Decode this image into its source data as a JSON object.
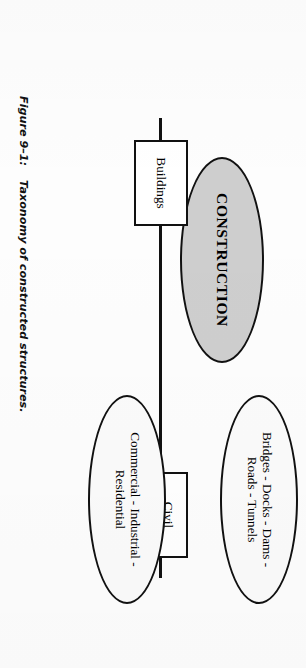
{
  "figure": {
    "caption_number": "Figure 9–1:",
    "caption_text": "Taxonomy of constructed structures.",
    "orientation": "rotated-90-clockwise",
    "colors": {
      "root_fill": "#cecece",
      "node_fill": "#ffffff",
      "stroke": "#111111",
      "page_background": "#ffffff"
    }
  },
  "diagram": {
    "type": "tree",
    "root": {
      "id": "construction",
      "shape": "ellipse",
      "label": "CONSTRUCTION",
      "fill": "#cecece"
    },
    "branches": [
      {
        "id": "civil-structures",
        "shape": "rectangle",
        "label_line_1": "Civil",
        "label_line_2": "Structures",
        "leaf": {
          "id": "civil-examples",
          "shape": "ellipse",
          "label_line_1": "Bridges - Docks - Dams -",
          "label_line_2": "Roads - Tunnels",
          "items": [
            "Bridges",
            "Docks",
            "Dams",
            "Roads",
            "Tunnels"
          ]
        }
      },
      {
        "id": "buildings",
        "shape": "rectangle",
        "label_line_1": "Buildings",
        "label_line_2": "",
        "leaf": {
          "id": "building-examples",
          "shape": "ellipse",
          "label_line_1": "Commercial - Industrial -",
          "label_line_2": "Residential",
          "items": [
            "Commercial",
            "Industrial",
            "Residential"
          ]
        }
      }
    ]
  }
}
